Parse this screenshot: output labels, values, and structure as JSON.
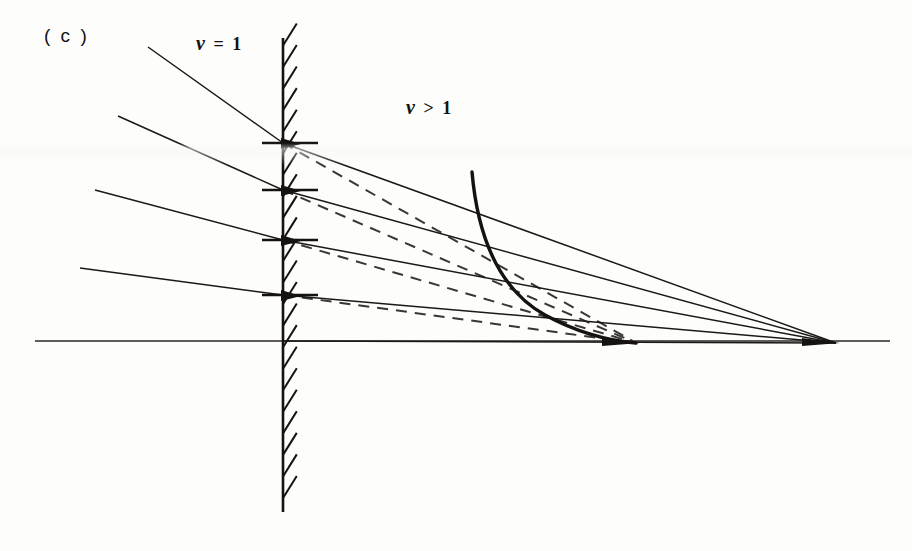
{
  "figure": {
    "panel_label": "( c )",
    "caption_kind": "ray-refraction-diagram",
    "background_color": "#fdfdfb",
    "ink_color": "#15120f",
    "labels": [
      {
        "name": "region-label-left",
        "text": "ν = 1",
        "x": 196,
        "y": 32
      },
      {
        "name": "region-label-right",
        "text": "ν > 1",
        "x": 406,
        "y": 96
      }
    ],
    "axis": {
      "name": "optical-axis",
      "x1": 35,
      "y1": 341,
      "x2": 890,
      "y2": 341,
      "stroke": "#2a2724",
      "width": 1.6
    },
    "interface": {
      "name": "hatched-boundary-wall",
      "x": 283,
      "y_top": 38,
      "y_bottom": 512,
      "stroke": "#15120f",
      "width": 2.6,
      "hatch_count": 22,
      "hatch_len": 26,
      "hatch_angle_deg": -58,
      "hatch_side": "right"
    },
    "impact_points": [
      {
        "name": "impact-point-1",
        "x": 283,
        "y": 143
      },
      {
        "name": "impact-point-2",
        "x": 283,
        "y": 190
      },
      {
        "name": "impact-point-3",
        "x": 283,
        "y": 240
      },
      {
        "name": "impact-point-4",
        "x": 283,
        "y": 295
      }
    ],
    "tick_marks": [
      {
        "name": "tick-mark-1",
        "x1": 262,
        "x2": 318,
        "y": 143
      },
      {
        "name": "tick-mark-2",
        "x1": 262,
        "x2": 318,
        "y": 190
      },
      {
        "name": "tick-mark-3",
        "x1": 262,
        "x2": 318,
        "y": 240
      },
      {
        "name": "tick-mark-4",
        "x1": 262,
        "x2": 318,
        "y": 295
      }
    ],
    "incident_rays": [
      {
        "name": "incident-ray-1",
        "x1": 148,
        "y1": 47,
        "x2": 283,
        "y2": 143
      },
      {
        "name": "incident-ray-2",
        "x1": 118,
        "y1": 116,
        "x2": 283,
        "y2": 190
      },
      {
        "name": "incident-ray-3",
        "x1": 95,
        "y1": 190,
        "x2": 283,
        "y2": 240
      },
      {
        "name": "incident-ray-4",
        "x1": 80,
        "y1": 268,
        "x2": 283,
        "y2": 295
      }
    ],
    "solid_focus": {
      "name": "solid-ray-focus",
      "x": 836,
      "y": 343
    },
    "dashed_focus": {
      "name": "dashed-ray-focus",
      "x": 636,
      "y": 343
    },
    "refracted_rays_solid": [
      {
        "name": "refracted-ray-solid-1",
        "x1": 283,
        "y1": 143,
        "x2": 836,
        "y2": 343
      },
      {
        "name": "refracted-ray-solid-2",
        "x1": 283,
        "y1": 190,
        "x2": 836,
        "y2": 343
      },
      {
        "name": "refracted-ray-solid-3",
        "x1": 283,
        "y1": 240,
        "x2": 836,
        "y2": 343
      },
      {
        "name": "refracted-ray-solid-4",
        "x1": 283,
        "y1": 295,
        "x2": 836,
        "y2": 343
      },
      {
        "name": "refracted-ray-solid-axis",
        "x1": 283,
        "y1": 341,
        "x2": 836,
        "y2": 343
      }
    ],
    "refracted_rays_dashed": [
      {
        "name": "refracted-ray-dashed-1",
        "x1": 283,
        "y1": 143,
        "x2": 636,
        "y2": 343
      },
      {
        "name": "refracted-ray-dashed-2",
        "x1": 283,
        "y1": 190,
        "x2": 636,
        "y2": 343
      },
      {
        "name": "refracted-ray-dashed-3",
        "x1": 283,
        "y1": 240,
        "x2": 636,
        "y2": 343
      },
      {
        "name": "refracted-ray-dashed-4",
        "x1": 283,
        "y1": 295,
        "x2": 636,
        "y2": 343
      }
    ],
    "caustic_curve": {
      "name": "caustic-curve",
      "stroke": "#15120f",
      "width": 3.4,
      "path": "M 472 172 C 478 240, 500 290, 545 315 C 580 334, 612 341, 636 343"
    }
  },
  "chart_data": {
    "type": "line",
    "title": "( c )",
    "xlabel": "",
    "ylabel": "",
    "annotations": [
      "ν = 1",
      "ν > 1"
    ],
    "series": [
      {
        "name": "incident-rays",
        "style": "solid",
        "x": [
          148,
          118,
          95,
          80
        ],
        "y": [
          47,
          116,
          190,
          268
        ],
        "x_end": [
          283,
          283,
          283,
          283
        ],
        "y_end": [
          143,
          190,
          240,
          295
        ]
      },
      {
        "name": "refracted-rays-solid",
        "style": "solid",
        "x": [
          283,
          283,
          283,
          283,
          283
        ],
        "y": [
          143,
          190,
          240,
          295,
          341
        ],
        "focus_x": 836,
        "focus_y": 343
      },
      {
        "name": "refracted-rays-dashed",
        "style": "dashed",
        "x": [
          283,
          283,
          283,
          283
        ],
        "y": [
          143,
          190,
          240,
          295
        ],
        "focus_x": 636,
        "focus_y": 343
      },
      {
        "name": "caustic",
        "style": "thick-solid",
        "x": [
          472,
          500,
          545,
          590,
          636
        ],
        "y": [
          172,
          262,
          315,
          335,
          343
        ]
      }
    ],
    "axis_line": {
      "x1": 35,
      "x2": 890,
      "y": 341
    },
    "boundary_line": {
      "x": 283,
      "y1": 38,
      "y2": 512
    },
    "grid": false,
    "legend": "none"
  }
}
